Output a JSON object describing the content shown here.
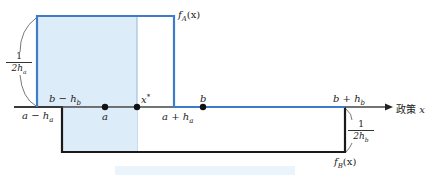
{
  "diagram": {
    "type": "two uniform distributions on a policy axis",
    "axis": {
      "label": "政策",
      "variable": "x"
    },
    "colors": {
      "f_A": "#3d7cc9",
      "f_A_fill": "#dcecf9",
      "f_B": "#1a1a1a",
      "axis": "#444444",
      "caption_band": "#eaf4fc"
    },
    "curves": {
      "f_A": {
        "label_func": "f",
        "label_sub": "A",
        "label_arg": "(x)"
      },
      "f_B": {
        "label_func": "f",
        "label_sub": "B",
        "label_arg": "(x)"
      }
    },
    "heights": {
      "f_A": {
        "num": "1",
        "den_main": "2h",
        "den_sub": "a"
      },
      "f_B": {
        "num": "1",
        "den_main": "2h",
        "den_sub": "b"
      }
    },
    "points": {
      "a_minus_ha": {
        "main": "a − h",
        "sub": "a"
      },
      "b_minus_hb": {
        "main": "b − h",
        "sub": "b"
      },
      "a": {
        "main": "a"
      },
      "x_star": {
        "main": "x",
        "sup": "*"
      },
      "a_plus_ha": {
        "main": "a + h",
        "sub": "a"
      },
      "b": {
        "main": "b"
      },
      "b_plus_hb": {
        "main": "b + h",
        "sub": "b"
      }
    }
  }
}
